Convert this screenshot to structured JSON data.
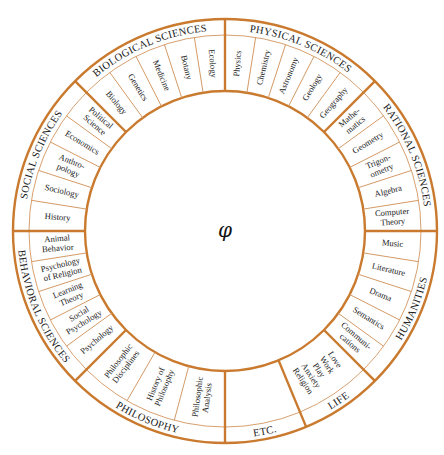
{
  "center_symbol": "φ",
  "colors": {
    "ring": "#c97a2e",
    "divider_thin": "#d49a66",
    "text": "#1a1a1a",
    "background": "#ffffff"
  },
  "geometry": {
    "cx": 225,
    "cy": 231,
    "r_outer": 212,
    "r_category": 196,
    "r_inner": 140
  },
  "sectors": [
    {
      "name": "RATIONAL SCIENCES",
      "start": 0,
      "end": 45,
      "items": [
        [
          "Computer",
          "Theory"
        ],
        [
          "Algebra"
        ],
        [
          "Trigon-",
          "ometry"
        ],
        [
          "Geometry"
        ],
        [
          "Mathe-",
          "matics"
        ]
      ]
    },
    {
      "name": "PHYSICAL SCIENCES",
      "start": 45,
      "end": 90,
      "items": [
        [
          "Geography"
        ],
        [
          "Geology"
        ],
        [
          "Astronomy"
        ],
        [
          "Chemistry"
        ],
        [
          "Physics"
        ]
      ]
    },
    {
      "name": "BIOLOGICAL SCIENCES",
      "start": 90,
      "end": 135,
      "items": [
        [
          "Ecology"
        ],
        [
          "Botany"
        ],
        [
          "Medicine"
        ],
        [
          "Genetics"
        ],
        [
          "Biology"
        ]
      ]
    },
    {
      "name": "SOCIAL SCIENCES",
      "start": 135,
      "end": 180,
      "items": [
        [
          "Political",
          "Science"
        ],
        [
          "Economics"
        ],
        [
          "Anthro-",
          "pology"
        ],
        [
          "Sociology"
        ],
        [
          "History"
        ]
      ]
    },
    {
      "name": "BEHAVIORAL SCIENCES",
      "start": 180,
      "end": 225,
      "items": [
        [
          "Animal",
          "Behavior"
        ],
        [
          "Psychology",
          "of Religion"
        ],
        [
          "Learning",
          "Theory"
        ],
        [
          "Social",
          "Psychology"
        ],
        [
          "Psychology"
        ]
      ]
    },
    {
      "name": "PHILOSOPHY",
      "start": 225,
      "end": 270,
      "items": [
        [
          "Philosophic",
          "Disciplines"
        ],
        [
          "History of",
          "Philosophy"
        ],
        [
          "Philosophic",
          "Analysis"
        ]
      ]
    },
    {
      "name": "ETC.",
      "start": 270,
      "end": 292.5,
      "items": [
        []
      ]
    },
    {
      "name": "LIFE",
      "start": 292.5,
      "end": 315,
      "items": [
        [
          "Love",
          "Work",
          "Play",
          "Anxiety",
          "Religion"
        ]
      ]
    },
    {
      "name": "HUMANITIES",
      "start": 315,
      "end": 360,
      "items": [
        [
          "Communi-",
          "cations"
        ],
        [
          "Semantics"
        ],
        [
          "Drama"
        ],
        [
          "Literature"
        ],
        [
          "Music"
        ]
      ]
    }
  ]
}
